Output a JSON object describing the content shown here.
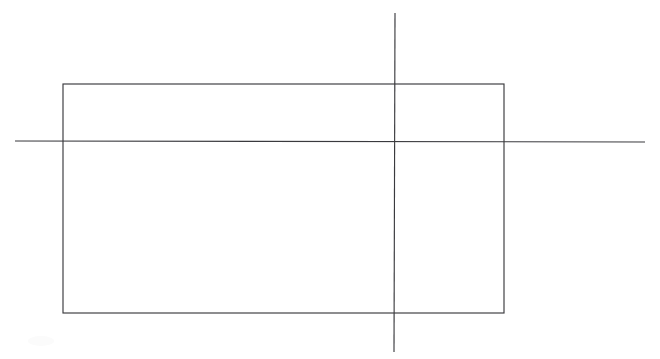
{
  "document": {
    "title": "Geometric figure: rectangle with intersecting axis lines",
    "background_color": "#ffffff",
    "width": 660,
    "height": 359
  },
  "figure": {
    "stroke_color": "#3a3a3e",
    "stroke_width": 1,
    "style": "scanned hand-drawn line art, thin dark gray strokes on white",
    "shapes": [
      {
        "name": "rectangle",
        "type": "rect",
        "x": 63,
        "y": 84,
        "width": 441,
        "height": 229,
        "fill": "none"
      },
      {
        "name": "horizontal-line",
        "type": "line",
        "x1": 15,
        "y1": 141,
        "x2": 645,
        "y2": 142
      },
      {
        "name": "vertical-line",
        "type": "line",
        "x1": 395,
        "y1": 13,
        "x2": 394,
        "y2": 352
      }
    ],
    "intersections": [
      {
        "name": "horizontal-with-left-edge",
        "x": 63,
        "y": 141
      },
      {
        "name": "horizontal-with-right-edge",
        "x": 504,
        "y": 142
      },
      {
        "name": "horizontal-with-vertical",
        "x": 395,
        "y": 142
      },
      {
        "name": "vertical-with-top-edge",
        "x": 395,
        "y": 84
      },
      {
        "name": "vertical-with-bottom-edge",
        "x": 395,
        "y": 313
      }
    ],
    "labels": []
  }
}
